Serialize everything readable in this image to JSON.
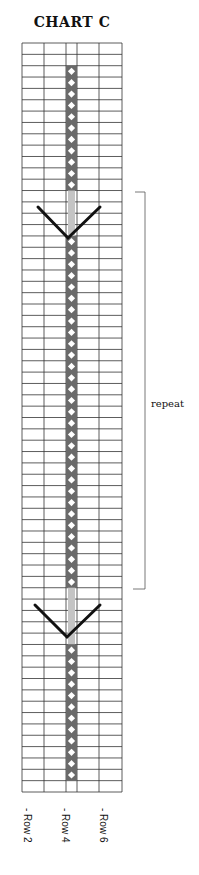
{
  "title": "CHART C",
  "grid": {
    "columns": 5,
    "rows": 66,
    "column_edges_px": [
      22,
      44,
      66,
      77,
      99,
      122
    ],
    "top_px": 43,
    "bottom_px": 792
  },
  "stitch_column": {
    "column_index": 2,
    "dark_color": "#6a6a6a",
    "light_color": "#c4c4c4",
    "dot_color": "#ffffff",
    "segments": [
      {
        "type": "dark",
        "from_row": 2,
        "to_row": 12
      },
      {
        "type": "light",
        "from_row": 13,
        "to_row": 16
      },
      {
        "type": "dark",
        "from_row": 17,
        "to_row": 47
      },
      {
        "type": "light",
        "from_row": 48,
        "to_row": 52
      },
      {
        "type": "dark",
        "from_row": 53,
        "to_row": 64
      }
    ]
  },
  "v_symbols": [
    {
      "name": "upper-v",
      "left": [
        38,
        207
      ],
      "vertex": [
        68,
        238
      ],
      "right": [
        100,
        207
      ]
    },
    {
      "name": "lower-v",
      "left": [
        35,
        605
      ],
      "vertex": [
        67,
        637
      ],
      "right": [
        100,
        605
      ]
    }
  ],
  "repeat_bracket": {
    "label": "repeat",
    "top_px": 192,
    "bottom_px": 589
  },
  "row_labels": [
    "- Row 2",
    "- Row 4",
    "- Row 6"
  ]
}
